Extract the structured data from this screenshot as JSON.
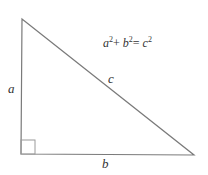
{
  "diagram": {
    "labels": {
      "side_a": "a",
      "side_b": "b",
      "side_c": "c"
    },
    "formula": {
      "a": "a",
      "b": "b",
      "c": "c",
      "exp": "2",
      "plus": "+",
      "equals": "=",
      "text": "a²+ b²= c²"
    },
    "colors": {
      "stroke": "#7a7a7a",
      "text": "#333333",
      "background": "#ffffff"
    }
  }
}
